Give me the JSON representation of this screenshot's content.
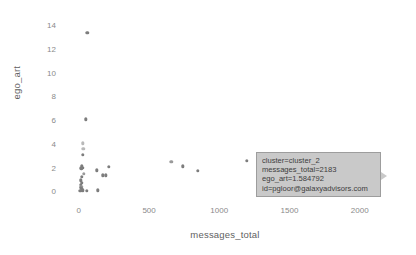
{
  "chart_data": {
    "type": "scatter",
    "title": "",
    "xlabel": "messages_total",
    "ylabel": "ego_art",
    "xlim": [
      -120,
      2230
    ],
    "ylim": [
      -0.9,
      14.6
    ],
    "xticks": [
      0,
      500,
      1000,
      1500,
      2000
    ],
    "yticks": [
      0,
      2,
      4,
      6,
      8,
      10,
      12,
      14
    ],
    "grid": false,
    "legend": "none",
    "series": [
      {
        "name": "points",
        "points": [
          {
            "x": 60,
            "y": 13.35
          },
          {
            "x": 48,
            "y": 6.08
          },
          {
            "x": 30,
            "y": 4.05
          },
          {
            "x": 33,
            "y": 3.6
          },
          {
            "x": 28,
            "y": 3.1
          },
          {
            "x": 22,
            "y": 2.15
          },
          {
            "x": 25,
            "y": 2.0
          },
          {
            "x": 18,
            "y": 1.95
          },
          {
            "x": 215,
            "y": 2.05
          },
          {
            "x": 128,
            "y": 1.78
          },
          {
            "x": 36,
            "y": 1.5
          },
          {
            "x": 170,
            "y": 1.35
          },
          {
            "x": 193,
            "y": 1.35
          },
          {
            "x": 20,
            "y": 1.2
          },
          {
            "x": 16,
            "y": 0.92
          },
          {
            "x": 19,
            "y": 0.72
          },
          {
            "x": 14,
            "y": 0.55
          },
          {
            "x": 17,
            "y": 0.4
          },
          {
            "x": 12,
            "y": 0.3
          },
          {
            "x": 21,
            "y": 0.18
          },
          {
            "x": 26,
            "y": 0.1
          },
          {
            "x": 10,
            "y": 0.05
          },
          {
            "x": 55,
            "y": 0.05
          },
          {
            "x": 133,
            "y": 0.08
          },
          {
            "x": 657,
            "y": 2.48
          },
          {
            "x": 742,
            "y": 2.1
          },
          {
            "x": 845,
            "y": 1.75
          },
          {
            "x": 1196,
            "y": 2.55
          }
        ]
      }
    ]
  },
  "tooltip": {
    "lines": [
      "cluster=cluster_2",
      "messages_total=2183",
      "ego_art=1.584792",
      "id=pgloor@galaxyadvisors.com"
    ]
  }
}
